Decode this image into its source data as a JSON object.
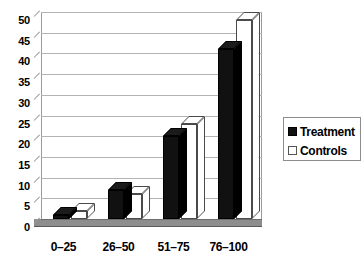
{
  "chart_data": {
    "type": "bar",
    "title": "",
    "xlabel": "",
    "ylabel": "",
    "ylim": [
      0,
      50
    ],
    "ytick_step": 5,
    "yticks": [
      "50",
      "45",
      "40",
      "35",
      "30",
      "25",
      "20",
      "15",
      "10",
      "5",
      "0"
    ],
    "ytick_values": [
      50,
      45,
      40,
      35,
      30,
      25,
      20,
      15,
      10,
      5,
      0
    ],
    "categories": [
      "0–25",
      "26–50",
      "51–75",
      "76–100"
    ],
    "grid": true,
    "legend_position": "right",
    "style": "3d-column",
    "series": [
      {
        "name": "Treatment",
        "values": [
          1,
          7,
          20,
          41
        ],
        "color": "#111111",
        "swatch": "dark"
      },
      {
        "name": "Controls",
        "values": [
          2,
          6,
          23,
          48
        ],
        "color": "#ffffff",
        "swatch": "light"
      }
    ]
  },
  "legend": {
    "items": [
      {
        "label": "Treatment",
        "swatch": "dark"
      },
      {
        "label": "Controls",
        "swatch": "light"
      }
    ]
  }
}
